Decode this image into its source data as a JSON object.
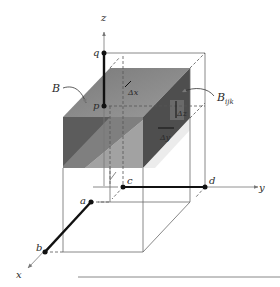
{
  "diagram": {
    "type": "3d-box-region-diagram",
    "axes": {
      "x_label": "x",
      "y_label": "y",
      "z_label": "z"
    },
    "points": {
      "q": "q",
      "p": "p",
      "a": "a",
      "b": "b",
      "c": "c",
      "d": "d"
    },
    "labels": {
      "box": "B",
      "subbox": "B",
      "subbox_subscript": "ijk",
      "delta_x": "Δx",
      "delta_y": "Δy",
      "delta_z": "Δz"
    },
    "colors": {
      "box_top": "#8a8a8a",
      "box_front_dark": "#5e5e5e",
      "box_front_light": "#a8a8a8",
      "box_right": "#4a4a4a",
      "line": "#555555",
      "thick_line": "#111111"
    }
  }
}
